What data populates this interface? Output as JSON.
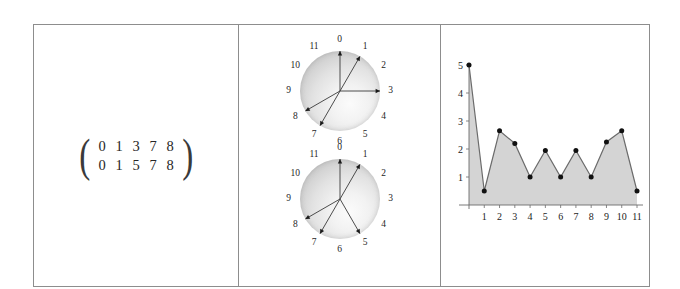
{
  "figure": {
    "panels": [
      "pitch-class-matrix",
      "clock-diagrams",
      "interval-chart"
    ]
  },
  "matrix": {
    "left_paren": "(",
    "right_paren": ")",
    "rows": [
      [
        "0",
        "1",
        "3",
        "7",
        "8"
      ],
      [
        "0",
        "1",
        "5",
        "7",
        "8"
      ]
    ]
  },
  "clocks": [
    {
      "name": "clock-top",
      "labels": [
        "0",
        "1",
        "2",
        "3",
        "4",
        "5",
        "6",
        "7",
        "8",
        "9",
        "10",
        "11"
      ],
      "marked": [
        0,
        1,
        3,
        7,
        8
      ]
    },
    {
      "name": "clock-bottom",
      "labels": [
        "0",
        "1",
        "2",
        "3",
        "4",
        "5",
        "6",
        "7",
        "8",
        "9",
        "10",
        "11"
      ],
      "marked": [
        0,
        1,
        5,
        7,
        8
      ]
    }
  ],
  "chart_data": {
    "type": "area",
    "title": "",
    "xlabel": "",
    "ylabel": "",
    "x": [
      0,
      1,
      2,
      3,
      4,
      5,
      6,
      7,
      8,
      9,
      10,
      11
    ],
    "values": [
      5,
      0.5,
      2.65,
      2.2,
      1,
      1.95,
      1,
      1.95,
      1,
      2.25,
      2.65,
      0.5
    ],
    "xticks": [
      "1",
      "2",
      "3",
      "4",
      "5",
      "6",
      "7",
      "8",
      "9",
      "10",
      "11"
    ],
    "xtick_values": [
      1,
      2,
      3,
      4,
      5,
      6,
      7,
      8,
      9,
      10,
      11
    ],
    "yticks": [
      "1",
      "2",
      "3",
      "4",
      "5"
    ],
    "ytick_values": [
      1,
      2,
      3,
      4,
      5
    ],
    "xlim": [
      0,
      11
    ],
    "ylim": [
      0,
      5
    ],
    "grid": false,
    "legend": null,
    "markers": true,
    "fill_color": "#d4d4d4",
    "line_color": "#6b6b6b",
    "marker_color": "#111111"
  },
  "colors": {
    "frame": "#8d8d8d",
    "text": "#262626",
    "sphere_light": "#fbfbfb",
    "sphere_dark": "#b2b2b2",
    "spoke": "#3a3a3a"
  }
}
